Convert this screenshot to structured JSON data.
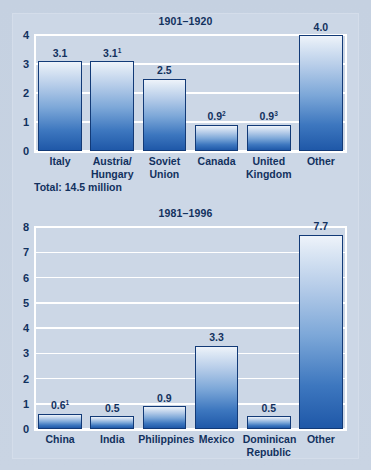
{
  "figure": {
    "background_color": "#ccd7e6",
    "accent_color": "#12315e",
    "bar_border_color": "#123a77",
    "gridline_color": "#ffffff",
    "total_note": "Total: 14.5 million"
  },
  "chart_data": [
    {
      "type": "bar",
      "title": "1901–1920",
      "xlabel": "",
      "ylabel": "",
      "ylim": [
        0,
        4
      ],
      "yticks": [
        "0",
        "1",
        "2",
        "3",
        "4"
      ],
      "grid": true,
      "legend": "none",
      "categories": [
        "Italy",
        "Austria/\nHungary",
        "Soviet\nUnion",
        "Canada",
        "United\nKingdom",
        "Other"
      ],
      "values": [
        3.1,
        3.1,
        2.5,
        0.9,
        0.9,
        4.0
      ],
      "labels": [
        "3.1",
        "3.1",
        "2.5",
        "0.9",
        "0.9",
        "4.0"
      ],
      "footnotes": [
        "",
        "1",
        "",
        "2",
        "3",
        ""
      ]
    },
    {
      "type": "bar",
      "title": "1981–1996",
      "xlabel": "",
      "ylabel": "",
      "ylim": [
        0,
        8
      ],
      "yticks": [
        "0",
        "1",
        "2",
        "3",
        "4",
        "5",
        "6",
        "7",
        "8"
      ],
      "grid": true,
      "legend": "none",
      "categories": [
        "China",
        "India",
        "Philippines",
        "Mexico",
        "Dominican\nRepublic",
        "Other"
      ],
      "values": [
        0.6,
        0.5,
        0.9,
        3.3,
        0.5,
        7.7
      ],
      "labels": [
        "0.6",
        "0.5",
        "0.9",
        "3.3",
        "0.5",
        "7.7"
      ],
      "footnotes": [
        "1",
        "",
        "",
        "",
        "",
        ""
      ]
    }
  ]
}
